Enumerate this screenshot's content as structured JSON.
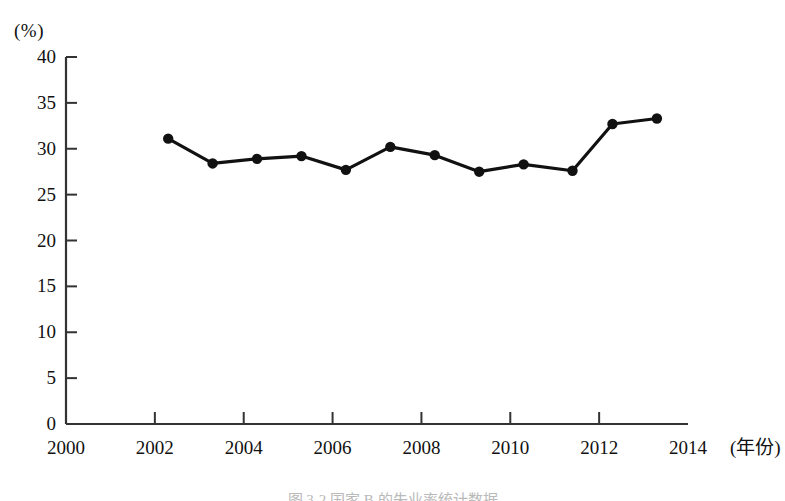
{
  "chart_data": {
    "type": "line",
    "title": "",
    "subtitle": "",
    "xlabel": "(年份)",
    "ylabel": "(%)",
    "xlim": [
      2000,
      2014
    ],
    "ylim": [
      0,
      40
    ],
    "grid": false,
    "legend": null,
    "x": [
      2002.3,
      2003.3,
      2004.3,
      2005.3,
      2006.3,
      2007.3,
      2008.3,
      2009.3,
      2010.3,
      2011.4,
      2012.3,
      2013.3
    ],
    "values": [
      31.1,
      28.4,
      28.9,
      29.2,
      27.7,
      30.2,
      29.3,
      27.5,
      28.3,
      27.6,
      32.7,
      33.3
    ],
    "series": [
      {
        "name": "",
        "values": [
          31.1,
          28.4,
          28.9,
          29.2,
          27.7,
          30.2,
          29.3,
          27.5,
          28.3,
          27.6,
          32.7,
          33.3
        ]
      }
    ],
    "x_tick_labels": [
      "2000",
      "2002",
      "2004",
      "2006",
      "2008",
      "2010",
      "2012",
      "2014"
    ],
    "x_tick_values": [
      2000,
      2002,
      2004,
      2006,
      2008,
      2010,
      2012,
      2014
    ],
    "y_tick_labels": [
      "0",
      "5",
      "10",
      "15",
      "20",
      "25",
      "30",
      "35",
      "40"
    ],
    "y_tick_values": [
      0,
      5,
      10,
      15,
      20,
      25,
      30,
      35,
      40
    ],
    "line_color": "#111111",
    "marker_color": "#111111",
    "axis_color": "#333333"
  },
  "figure": {
    "caption": "图 3-2 国家 B 的失业率统计数据"
  }
}
